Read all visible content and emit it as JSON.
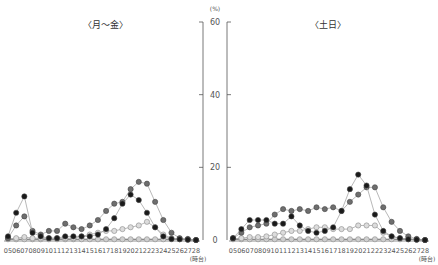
{
  "chart_data": [
    {
      "type": "line",
      "title": "〈月～金〉",
      "xlabel": "(時台)",
      "ylabel": "(%)",
      "ylim": [
        0,
        60
      ],
      "yticks": [
        0,
        20,
        40,
        60
      ],
      "grid": false,
      "legend": "none",
      "x": [
        "05",
        "06",
        "07",
        "08",
        "09",
        "10",
        "11",
        "12",
        "13",
        "14",
        "15",
        "16",
        "17",
        "18",
        "19",
        "20",
        "21",
        "22",
        "23",
        "24",
        "25",
        "26",
        "27",
        "28"
      ],
      "series": [
        {
          "name": "series-black",
          "color": "#1a1a1a",
          "values": [
            1,
            7.5,
            12,
            2,
            1,
            0.5,
            0.5,
            1,
            1,
            1,
            1,
            1.5,
            3,
            6,
            10,
            12.5,
            11,
            7.5,
            3.5,
            1,
            0.3,
            0.2,
            0.1,
            0
          ]
        },
        {
          "name": "series-darkgray",
          "color": "#6e6e6e",
          "values": [
            0.5,
            4,
            6.5,
            2.5,
            1.5,
            2.5,
            2.5,
            4.5,
            3.5,
            3,
            4,
            5.5,
            8,
            10,
            10.5,
            14,
            16,
            15.5,
            10.5,
            5.5,
            2,
            0.5,
            0.3,
            0
          ]
        },
        {
          "name": "series-lightgray",
          "color": "#b5b5b5",
          "values": [
            0.3,
            0.5,
            0.8,
            0.5,
            0.5,
            0.5,
            0.5,
            0.5,
            0.5,
            1,
            1.5,
            2,
            2.5,
            2.5,
            3,
            3.5,
            4,
            5,
            3.5,
            1.5,
            0.5,
            0.3,
            0.1,
            0
          ]
        },
        {
          "name": "series-baseline",
          "color": "#9a9a9a",
          "values": [
            0.2,
            0.2,
            0.2,
            0.2,
            0.2,
            0.2,
            0.2,
            0.2,
            0.2,
            0.2,
            0.2,
            0.2,
            0.2,
            0.2,
            0.2,
            0.2,
            0.2,
            0.2,
            0.2,
            0.2,
            0.2,
            0.2,
            0.1,
            0
          ]
        }
      ]
    },
    {
      "type": "line",
      "title": "〈土日〉",
      "xlabel": "(時台)",
      "ylabel": "(%)",
      "ylim": [
        0,
        60
      ],
      "yticks": [
        0,
        20,
        40,
        60
      ],
      "grid": false,
      "legend": "none",
      "x": [
        "05",
        "06",
        "07",
        "08",
        "09",
        "10",
        "11",
        "12",
        "13",
        "14",
        "15",
        "16",
        "17",
        "18",
        "19",
        "20",
        "21",
        "22",
        "23",
        "24",
        "25",
        "26",
        "27",
        "28"
      ],
      "series": [
        {
          "name": "series-black",
          "color": "#1a1a1a",
          "values": [
            0.5,
            3,
            5.5,
            5.5,
            5.5,
            4.5,
            4.5,
            6.5,
            4,
            2.5,
            2,
            2.5,
            3.5,
            8,
            14,
            18,
            15,
            7,
            2.5,
            1,
            0.5,
            0.2,
            0.1,
            0
          ]
        },
        {
          "name": "series-darkgray",
          "color": "#6e6e6e",
          "values": [
            0.5,
            2,
            3.5,
            4,
            4.5,
            7,
            8.5,
            8,
            8.5,
            8,
            9,
            8.5,
            9,
            8,
            10.5,
            12.5,
            14.5,
            14.5,
            9,
            5,
            2.5,
            1,
            0.3,
            0
          ]
        },
        {
          "name": "series-lightgray",
          "color": "#b5b5b5",
          "values": [
            0.3,
            0.5,
            0.8,
            0.8,
            1,
            1.5,
            2,
            2.5,
            2.5,
            3,
            3.5,
            3.5,
            3,
            3,
            3,
            4,
            4,
            4,
            2,
            1,
            0.5,
            0.3,
            0.1,
            0
          ]
        },
        {
          "name": "series-baseline",
          "color": "#9a9a9a",
          "values": [
            0.2,
            0.2,
            0.2,
            0.2,
            0.2,
            0.2,
            0.2,
            0.2,
            0.2,
            0.2,
            0.2,
            0.2,
            0.2,
            0.2,
            0.2,
            0.2,
            0.2,
            0.2,
            0.2,
            0.2,
            0.2,
            0.2,
            0.1,
            0
          ]
        }
      ]
    }
  ],
  "axis": {
    "unit_label": "(%)",
    "tick_labels": [
      "0",
      "20",
      "40",
      "60"
    ],
    "x_unit": "(時台)"
  }
}
